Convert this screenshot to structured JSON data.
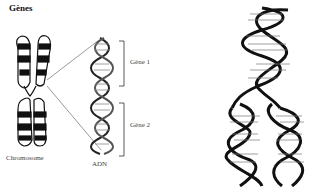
{
  "figure": {
    "title": "Gènes",
    "labels": {
      "chromosome": "Chromosome",
      "dna": "ADN",
      "gene1": "Gène 1",
      "gene2": "Gène 2"
    },
    "replication_bases": {
      "top_helix": [
        "A",
        "C",
        "G",
        "G",
        "T",
        "G",
        "C",
        "G",
        "C",
        "T",
        "A",
        "C",
        "G",
        "T",
        "A",
        "G",
        "A",
        "A",
        "T",
        "A"
      ],
      "left_daughter": [
        "T",
        "A",
        "A",
        "T",
        "C",
        "A",
        "C",
        "T",
        "G",
        "A",
        "A",
        "C",
        "C",
        "A",
        "G",
        "A"
      ],
      "right_daughter": [
        "A",
        "T",
        "A",
        "G",
        "C",
        "G",
        "A",
        "G",
        "C",
        "G",
        "T",
        "A",
        "C"
      ]
    },
    "colors": {
      "ink": "#111111",
      "label": "#444444",
      "background": "#ffffff"
    }
  }
}
